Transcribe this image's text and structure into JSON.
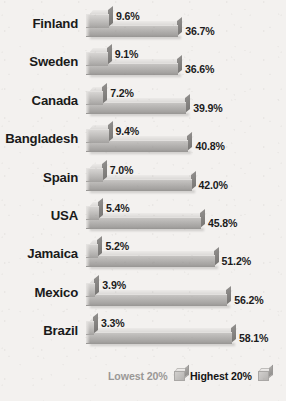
{
  "chart_data": {
    "type": "bar",
    "orientation": "horizontal",
    "title": "",
    "subtitle": "",
    "xlabel": "",
    "ylabel": "",
    "grid": false,
    "legend_position": "bottom",
    "value_suffix": "%",
    "xlim": [
      0,
      60
    ],
    "categories": [
      "Finland",
      "Sweden",
      "Canada",
      "Bangladesh",
      "Spain",
      "USA",
      "Jamaica",
      "Mexico",
      "Brazil"
    ],
    "series": [
      {
        "name": "Lowest 20%",
        "color": "#bdbbb9",
        "values": [
          9.6,
          9.1,
          7.2,
          9.4,
          7.0,
          5.4,
          5.2,
          3.9,
          3.3
        ],
        "labels": [
          "9.6%",
          "9.1%",
          "7.2%",
          "9.4%",
          "7.0%",
          "5.4%",
          "5.2%",
          "3.9%",
          "3.3%"
        ]
      },
      {
        "name": "Highest 20%",
        "color": "#ababa9",
        "values": [
          36.7,
          36.6,
          39.9,
          40.8,
          42.0,
          45.8,
          51.2,
          56.2,
          58.1
        ],
        "labels": [
          "36.7%",
          "36.6%",
          "39.9%",
          "40.8%",
          "42.0%",
          "45.8%",
          "51.2%",
          "56.2%",
          "58.1%"
        ]
      }
    ]
  },
  "legend": {
    "lowest_label": "Lowest 20%",
    "highest_label": "Highest 20%"
  }
}
